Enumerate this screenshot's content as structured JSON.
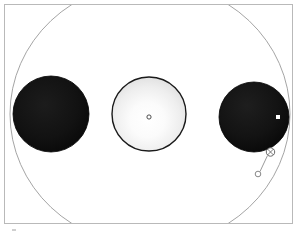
{
  "figure": {
    "type": "diagram",
    "title": "",
    "background_color": "#ffffff",
    "canvas": {
      "width": 300,
      "height": 235
    }
  },
  "frame": {
    "name": "plot-border",
    "x": 4,
    "y": 4,
    "width": 289,
    "height": 220,
    "stroke_color": "#b9b9b9",
    "stroke_width": 1,
    "fill": "none"
  },
  "orbit": {
    "name": "orbit-ellipse",
    "label": "",
    "center_x": 150,
    "center_y": 114,
    "radius_x": 140,
    "radius_y": 132,
    "stroke_color": "#9a9a9a",
    "stroke_width": 0.9,
    "fill": "none",
    "clipped_by_frame": true
  },
  "bodies": [
    {
      "name": "left-dark-sphere",
      "id": "body-left",
      "cx": 51,
      "cy": 114,
      "r": 38,
      "fill": "#0d0d0d",
      "shading": "radial-dark",
      "stroke_color": "#000000",
      "stroke_width": 0.8,
      "marker": null
    },
    {
      "name": "center-light-sphere",
      "id": "body-center",
      "cx": 149,
      "cy": 114,
      "r": 37,
      "fill": "#f7f7f7",
      "shading": "radial-light",
      "stroke_color": "#1a1a1a",
      "stroke_width": 1.4,
      "marker": {
        "name": "center-point-marker",
        "shape": "circle-open",
        "cx": 149,
        "cy": 117,
        "r": 2.1,
        "stroke_color": "#3a3a3a",
        "fill": "#ffffff"
      }
    },
    {
      "name": "right-dark-sphere",
      "id": "body-right",
      "cx": 254,
      "cy": 117,
      "r": 35,
      "fill": "#0d0d0d",
      "shading": "radial-dark",
      "stroke_color": "#000000",
      "stroke_width": 0.8,
      "marker": {
        "name": "white-square-marker",
        "shape": "square-filled",
        "cx": 278,
        "cy": 117,
        "size": 4,
        "fill": "#ffffff"
      }
    }
  ],
  "annotations": [
    {
      "name": "crossed-circle-marker",
      "shape": "circle-with-cross",
      "cx": 270.5,
      "cy": 152,
      "r": 4.2,
      "stroke_color": "#5a5a5a",
      "fill": "#ffffff"
    },
    {
      "name": "small-circle-marker",
      "shape": "circle-open",
      "cx": 258,
      "cy": 174,
      "r": 2.8,
      "stroke_color": "#7a7a7a",
      "fill": "#ffffff"
    },
    {
      "name": "connector-line",
      "shape": "line",
      "x1": 267.5,
      "y1": 155.5,
      "x2": 260,
      "y2": 171.5,
      "stroke_color": "#8f8f8f",
      "stroke_width": 0.9
    }
  ],
  "artifacts": [
    {
      "name": "corner-speck",
      "x": 12,
      "y": 229,
      "width": 4,
      "height": 2,
      "color": "#cfcfcf"
    }
  ],
  "colors": {
    "dark_body": "#0d0d0d",
    "light_body": "#f7f7f7",
    "orbit_stroke": "#9a9a9a",
    "frame_stroke": "#b9b9b9",
    "marker_stroke": "#5a5a5a",
    "background": "#ffffff"
  }
}
